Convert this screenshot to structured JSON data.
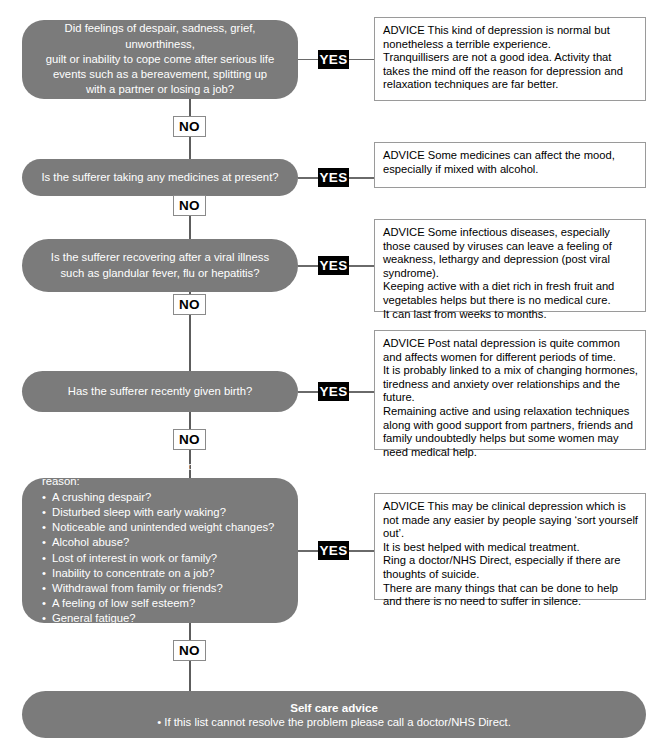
{
  "colors": {
    "box_fill": "#7b7b7b",
    "box_text": "#ffffff",
    "yes_badge_bg": "#000000",
    "yes_badge_text": "#ffffff",
    "no_badge_bg": "#ffffff",
    "no_badge_text": "#000000",
    "advice_border": "#9a9a9a",
    "connector": "#5d5d5d",
    "page_bg": "#ffffff"
  },
  "labels": {
    "yes": "YES",
    "no": "NO",
    "advice_prefix": "ADVICE"
  },
  "steps": [
    {
      "question": "Did feelings of despair, sadness, grief, unworthiness,\nguilt or inability to cope come after serious life\nevents such as a bereavement, splitting up\nwith a partner or losing a job?",
      "yes": "YES",
      "no": "NO",
      "advice": [
        "ADVICE This kind of depression is normal but nonetheless a terrible experience.",
        "Tranquillisers are not a good idea. Activity that takes the mind off the reason for depression and relaxation techniques are far better."
      ]
    },
    {
      "question": "Is the sufferer taking any medicines at present?",
      "yes": "YES",
      "no": "NO",
      "advice": [
        "ADVICE Some medicines can affect the mood, especially if mixed with alcohol."
      ]
    },
    {
      "question": "Is the sufferer recovering after a viral illness\nsuch as glandular fever, flu or hepatitis?",
      "yes": "YES",
      "no": "NO",
      "advice": [
        "ADVICE Some infectious diseases, especially those caused by viruses can leave a feeling of weakness, lethargy and depression (post viral syndrome).",
        "Keeping active with a diet rich in fresh fruit and vegetables helps but there is no medical cure.",
        "It can last from weeks to months."
      ]
    },
    {
      "question": "Has the sufferer recently given birth?",
      "yes": "YES",
      "no": "NO",
      "advice": [
        "ADVICE Post natal depression is quite common and affects women for different periods of time.",
        "It is probably linked to a mix of changing hormones, tiredness and anxiety over relationships and the future.",
        "Remaining active and using relaxation techniques along with good support from partners, friends and family undoubtedly helps but some women may need medical help."
      ]
    },
    {
      "question_lead": "Is the sufferer experiencing, for no apparent reason:",
      "symptoms": [
        "A crushing despair?",
        "Disturbed sleep with early waking?",
        "Noticeable and unintended weight changes?",
        "Alcohol abuse?",
        "Lost of interest in work or family?",
        "Inability to concentrate on a job?",
        "Withdrawal from family or friends?",
        "A feeling of low self esteem?",
        "General fatigue?",
        "Thoughts of suicide?"
      ],
      "yes": "YES",
      "no": "NO",
      "advice": [
        "ADVICE This may be clinical depression which is not made any easier by people saying ‘sort yourself out’.",
        "It is best helped with medical treatment.",
        "Ring a doctor/NHS Direct, especially if there are thoughts of suicide.",
        "There are many things that can be done to help and there is no need to suffer in silence."
      ]
    }
  ],
  "self_care": {
    "title": "Self care advice",
    "line": "• If this list cannot resolve the problem please call a doctor/NHS Direct."
  }
}
